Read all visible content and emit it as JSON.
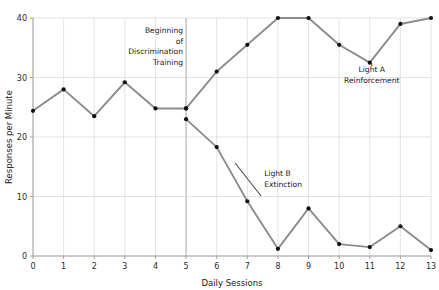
{
  "chart_data": {
    "type": "line",
    "title": "",
    "xlabel": "Daily Sessions",
    "ylabel": "Responses per Minute",
    "xlim": [
      0,
      13
    ],
    "ylim": [
      0,
      40
    ],
    "xticks": [
      "0",
      "1",
      "2",
      "3",
      "4",
      "5",
      "6",
      "7",
      "8",
      "9",
      "10",
      "11",
      "12",
      "13"
    ],
    "yticks": [
      "0",
      "10",
      "20",
      "30",
      "40"
    ],
    "grid": true,
    "legend": "none (inline annotations)",
    "x": [
      0,
      1,
      2,
      3,
      4,
      5,
      6,
      7,
      8,
      9,
      10,
      11,
      12,
      13
    ],
    "series": [
      {
        "name": "Baseline",
        "x": [
          0,
          1,
          2,
          3,
          4,
          5
        ],
        "values": [
          24.4,
          28.0,
          23.5,
          29.2,
          24.8,
          24.8
        ]
      },
      {
        "name": "Light A Reinforcement",
        "x": [
          5,
          6,
          7,
          8,
          9,
          10,
          11,
          12,
          13
        ],
        "values": [
          24.8,
          31.0,
          35.5,
          40.0,
          40.0,
          35.5,
          32.5,
          39.0,
          40.0
        ]
      },
      {
        "name": "Light B Extinction",
        "x": [
          5,
          6,
          7,
          8,
          9,
          10,
          11,
          12,
          13
        ],
        "values": [
          23.0,
          18.3,
          9.2,
          1.2,
          8.0,
          2.0,
          1.5,
          5.0,
          1.0
        ]
      }
    ],
    "annotations": [
      {
        "id": "beginning-discrimination-training",
        "lines": [
          "Beginning",
          "of",
          "Discrimination",
          "Training"
        ],
        "x_session": 5,
        "align": "right"
      },
      {
        "id": "light-a-reinforcement",
        "lines": [
          "Light  A",
          "Reinforcement"
        ],
        "x_session": 11,
        "align": "center"
      },
      {
        "id": "light-b-extinction",
        "lines": [
          "Light  B",
          "Extinction"
        ],
        "x_session": 7.6,
        "align": "left"
      }
    ],
    "colors": {
      "line": "#8c8c8c",
      "marker": "#101010",
      "grid": "#d8d8d8",
      "axis": "#9a9a9a",
      "background": "#ffffff",
      "text": "#1a1a1a"
    },
    "vertical_divider_session": 5
  },
  "cropped_header_text": ""
}
